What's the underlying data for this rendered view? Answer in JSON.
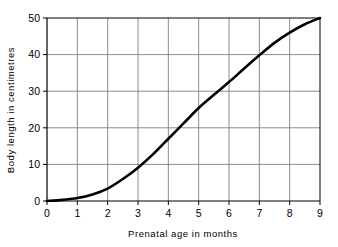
{
  "chart_data": {
    "type": "line",
    "title": "",
    "xlabel": "Prenatal age in months",
    "ylabel": "Body length in centimetres",
    "xlim": [
      0,
      9
    ],
    "ylim": [
      0,
      50
    ],
    "xticks": [
      "0",
      "1",
      "2",
      "3",
      "4",
      "5",
      "6",
      "7",
      "8",
      "9"
    ],
    "yticks": [
      "0",
      "10",
      "20",
      "30",
      "40",
      "50"
    ],
    "grid": true,
    "legend": "none",
    "series": [
      {
        "name": "Body length",
        "x": [
          0,
          0.5,
          1,
          1.5,
          2,
          2.5,
          3,
          3.5,
          4,
          4.5,
          5,
          5.5,
          6,
          6.5,
          7,
          7.5,
          8,
          8.5,
          9
        ],
        "values": [
          0,
          0.3,
          0.8,
          1.8,
          3.4,
          6.0,
          9.1,
          12.8,
          17.0,
          21.2,
          25.4,
          29.0,
          32.5,
          36.2,
          39.8,
          43.2,
          46.0,
          48.3,
          50.0
        ]
      }
    ],
    "line_color": "#000000",
    "grid_color": "#808080",
    "axis_color": "#000000"
  }
}
